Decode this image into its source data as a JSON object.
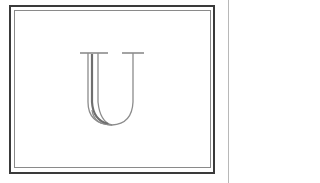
{
  "card": {
    "monogram_letter": "U",
    "colors": {
      "outer_border": "#3a3a3a",
      "inner_border": "#8a8a8a",
      "letter_stroke": "#8c8c8c",
      "letter_shade": "#6e6e6e",
      "side_rule": "#b8b8b8",
      "background": "#ffffff"
    }
  }
}
